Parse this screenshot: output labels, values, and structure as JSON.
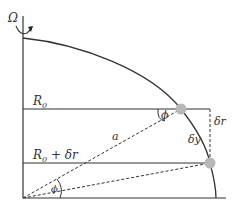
{
  "diagram": {
    "labels": {
      "omega": "Ω",
      "r0": "R",
      "r0_sub": "0",
      "r0_dr_main": "R",
      "r0_dr_sub": "0",
      "r0_dr_rest": " + δr",
      "phi_upper": "ϕ",
      "phi_lower": "ϕ",
      "a": "a",
      "dr": "δr",
      "dy": "δy"
    },
    "colors": {
      "line": "#333333",
      "dot": "#b8b8b8",
      "background": "#ffffff"
    },
    "elements": {
      "rotation_axis": "vertical line with rotation arrow Ω",
      "surface_arc": "curved boundary from top of axis to base",
      "horizontal_lines": [
        "R0",
        "R0 + δr",
        "base"
      ],
      "points": [
        "upper particle on R0",
        "lower particle on R0 + δr"
      ],
      "dashed_lines": [
        "origin to upper particle (a)",
        "origin to lower particle",
        "vertical δr segment"
      ]
    }
  }
}
